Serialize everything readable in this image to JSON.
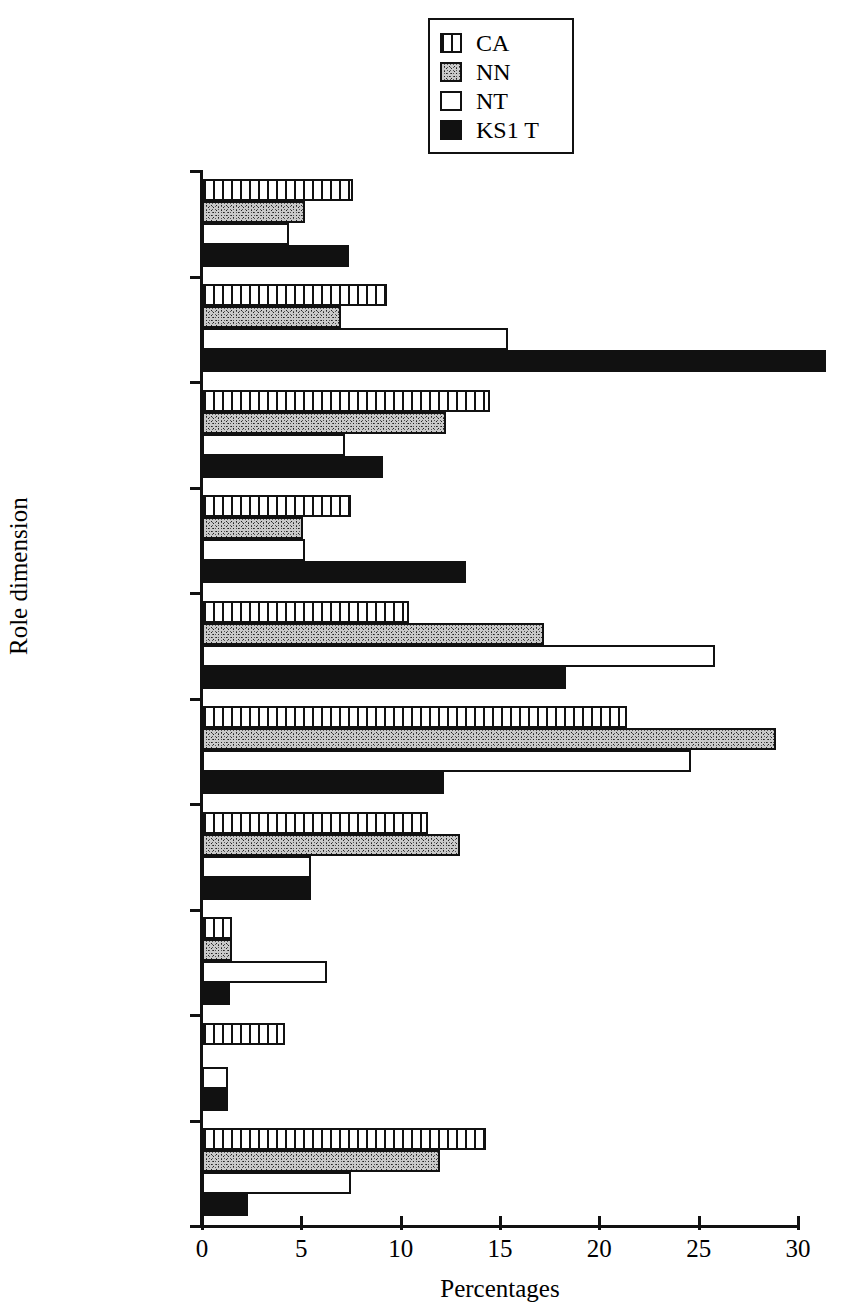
{
  "chart_data": {
    "type": "bar",
    "orientation": "horizontal",
    "title": "",
    "xlabel": "Percentages",
    "ylabel": "Role dimension",
    "xlim": [
      0,
      30
    ],
    "xticks": [
      0,
      5,
      10,
      15,
      20,
      25,
      30
    ],
    "grid": false,
    "legend_position": "top-center",
    "categories": [
      "No act/chdn",
      "Management",
      "Mon. behaviour",
      "Mon. learning",
      "Dir. Instr.",
      "Support lng.",
      "Soc/Phy Needs",
      "Assessment",
      "Recording",
      "Res. Prov."
    ],
    "category_lines": [
      [
        "No act/chdn"
      ],
      [
        "Management"
      ],
      [
        "Mon.",
        "behaviour"
      ],
      [
        "Mon.",
        "learning"
      ],
      [
        "Dir. Instr."
      ],
      [
        "Support Ing."
      ],
      [
        "Soc/Phy",
        "Needs"
      ],
      [
        "Assessment"
      ],
      [
        "Recording"
      ],
      [
        "Res. Prov."
      ]
    ],
    "series": [
      {
        "name": "CA",
        "pattern": "vertical-stripes",
        "color": "#ffffff",
        "values": [
          7.6,
          9.3,
          14.5,
          7.5,
          10.4,
          21.4,
          11.4,
          1.5,
          4.2,
          14.3
        ]
      },
      {
        "name": "NN",
        "pattern": "stipple",
        "color": "#c9c9c9",
        "values": [
          5.2,
          7.0,
          12.3,
          5.1,
          17.2,
          28.9,
          13.0,
          1.5,
          0.0,
          12.0
        ]
      },
      {
        "name": "NT",
        "pattern": "empty",
        "color": "#ffffff",
        "values": [
          4.4,
          15.4,
          7.2,
          5.2,
          25.8,
          24.6,
          5.5,
          6.3,
          1.3,
          7.5
        ]
      },
      {
        "name": "KS1 T",
        "pattern": "solid",
        "color": "#111111",
        "values": [
          7.4,
          31.4,
          9.1,
          13.3,
          18.3,
          12.2,
          5.5,
          1.4,
          1.3,
          2.3
        ]
      }
    ]
  },
  "legend": {
    "items": [
      {
        "label": "CA",
        "pattern": "pat-ca"
      },
      {
        "label": "NN",
        "pattern": "pat-nn"
      },
      {
        "label": "NT",
        "pattern": "pat-nt"
      },
      {
        "label": "KS1 T",
        "pattern": "pat-ks"
      }
    ]
  }
}
